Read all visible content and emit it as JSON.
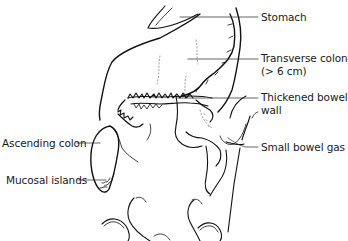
{
  "diagram": {
    "type": "anatomical line drawing",
    "labels": [
      {
        "id": "stomach",
        "text": "Stomach"
      },
      {
        "id": "transverse-colon",
        "text": "Transverse colon",
        "text_line2": "(> 6 cm)"
      },
      {
        "id": "thickened-bowel-wall",
        "text": "Thickened bowel",
        "text_line2": "wall"
      },
      {
        "id": "small-bowel-gas",
        "text": "Small bowel gas"
      },
      {
        "id": "ascending-colon",
        "text": "Ascending colon"
      },
      {
        "id": "mucosal-islands",
        "text": "Mucosal islands"
      }
    ],
    "colors": {
      "line": "#111111",
      "background": "#ffffff"
    }
  }
}
